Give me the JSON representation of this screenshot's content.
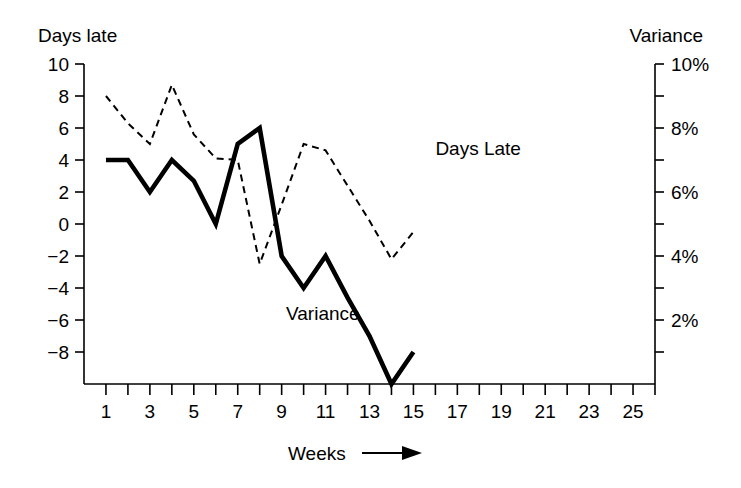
{
  "chart_data": {
    "type": "line",
    "title": "",
    "xlabel": "Weeks",
    "xlabel_arrow": "→",
    "ylabel_left": "Days late",
    "ylabel_right": "Variance",
    "xlim": [
      0,
      26
    ],
    "x_ticks_major": [
      1,
      3,
      5,
      7,
      9,
      11,
      13,
      15,
      17,
      19,
      21,
      23,
      25
    ],
    "x_tick_labels": [
      "1",
      "3",
      "5",
      "7",
      "9",
      "11",
      "13",
      "15",
      "17",
      "19",
      "21",
      "23",
      "25"
    ],
    "x_ticks_minor": [
      2,
      4,
      6,
      8,
      10,
      12,
      14,
      16,
      18,
      20,
      22,
      24,
      26
    ],
    "ylim_left": [
      -10,
      10
    ],
    "y_ticks_left": [
      10,
      8,
      6,
      4,
      2,
      0,
      -2,
      -4,
      -6,
      -8
    ],
    "y_tick_labels_left": [
      "10",
      "8",
      "6",
      "4",
      "2",
      "0",
      "−2",
      "−4",
      "−6",
      "−8"
    ],
    "ylim_right": [
      0,
      10
    ],
    "y_ticks_right_major": [
      10,
      8,
      6,
      4,
      2
    ],
    "y_tick_labels_right": [
      "10%",
      "8%",
      "6%",
      "4%",
      "2%"
    ],
    "y_ticks_right_minor": [
      9,
      7,
      5,
      3,
      1
    ],
    "grid": false,
    "legend_position": "inline-annotations",
    "series": [
      {
        "name": "Days Late",
        "style": "dashed",
        "axis": "left",
        "label_text": "Days Late",
        "label_x": 16.0,
        "label_y": 4.3,
        "x": [
          1,
          2,
          3,
          4,
          5,
          6,
          7,
          8,
          9,
          10,
          11,
          12,
          13,
          14,
          15
        ],
        "values": [
          8.0,
          6.3,
          5.0,
          8.7,
          5.6,
          4.1,
          4.0,
          -2.5,
          1.2,
          5.0,
          4.6,
          2.4,
          0.2,
          -2.2,
          -0.5
        ]
      },
      {
        "name": "Variance",
        "style": "solid",
        "axis": "left",
        "label_text": "Variance",
        "label_x": 9.2,
        "label_y": -6.0,
        "x": [
          1,
          2,
          3,
          4,
          5,
          6,
          7,
          8,
          9,
          10,
          11,
          12,
          13,
          14,
          15
        ],
        "values": [
          4.0,
          4.0,
          2.0,
          4.0,
          2.7,
          0.0,
          5.0,
          6.0,
          -2.0,
          -4.0,
          -2.0,
          -4.6,
          -7.0,
          -10.0,
          -8.0
        ]
      }
    ]
  },
  "annotations": {
    "days_late": "Days Late",
    "variance": "Variance"
  },
  "axes": {
    "left_title": "Days late",
    "right_title": "Variance",
    "bottom_title": "Weeks"
  },
  "colors": {
    "ink": "#000000",
    "background": "#ffffff"
  }
}
